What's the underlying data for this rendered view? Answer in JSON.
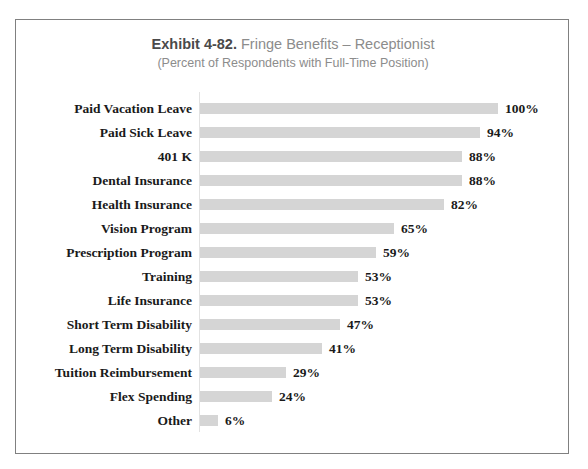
{
  "chart_data": {
    "type": "bar",
    "orientation": "horizontal",
    "title": "Exhibit 4-82.  Fringe Benefits – Receptionist",
    "title_strong": "Exhibit 4-82.",
    "title_rest": "Fringe Benefits – Receptionist",
    "subtitle": "(Percent of Respondents with Full-Time Position)",
    "xlabel": "",
    "ylabel": "",
    "xlim": [
      0,
      100
    ],
    "grid": false,
    "legend": false,
    "value_suffix": "%",
    "bar_color": "#d5d5d5",
    "categories": [
      "Paid Vacation Leave",
      "Paid Sick Leave",
      "401 K",
      "Dental Insurance",
      "Health Insurance",
      "Vision Program",
      "Prescription Program",
      "Training",
      "Life Insurance",
      "Short Term Disability",
      "Long Term Disability",
      "Tuition Reimbursement",
      "Flex Spending",
      "Other"
    ],
    "values": [
      100,
      94,
      88,
      88,
      82,
      65,
      59,
      53,
      53,
      47,
      41,
      29,
      24,
      6
    ],
    "value_labels": [
      "100%",
      "94%",
      "88%",
      "88%",
      "82%",
      "65%",
      "59%",
      "53%",
      "53%",
      "47%",
      "41%",
      "29%",
      "24%",
      "6%"
    ]
  }
}
